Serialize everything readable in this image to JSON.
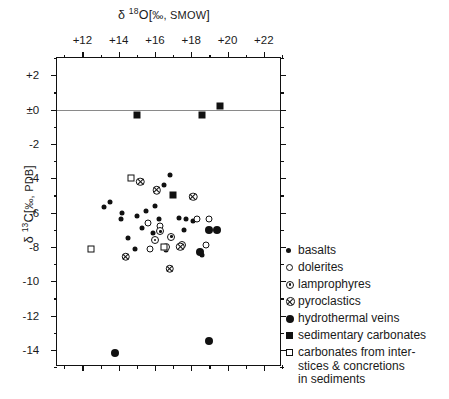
{
  "chart_data": {
    "type": "scatter",
    "title": "",
    "xlabel": "δ 18O[‰, SMOW]",
    "ylabel": "δ 13C[‰, PDB]",
    "xlim": [
      10.6,
      23.0
    ],
    "ylim": [
      -15.0,
      3.0
    ],
    "xticks": [
      "+12",
      "+14",
      "+16",
      "+18",
      "+20",
      "+22"
    ],
    "xtick_values": [
      12,
      14,
      16,
      18,
      20,
      22
    ],
    "yticks": [
      "+2",
      "±0",
      "-2",
      "-4",
      "-6",
      "-8",
      "-10",
      "-12",
      "-14"
    ],
    "ytick_values": [
      2,
      0,
      -2,
      -4,
      -6,
      -8,
      -10,
      -12,
      -14
    ],
    "minor_tick_step": 1,
    "grid": false,
    "zero_line": true,
    "legend_position": "right",
    "series": [
      {
        "name": "basalts",
        "marker": "filled-circle-small",
        "points": [
          [
            13.2,
            -5.7
          ],
          [
            13.5,
            -5.4
          ],
          [
            14.2,
            -6.0
          ],
          [
            14.1,
            -6.4
          ],
          [
            15.0,
            -6.2
          ],
          [
            15.5,
            -5.9
          ],
          [
            16.8,
            -3.8
          ],
          [
            16.5,
            -4.4
          ],
          [
            17.3,
            -6.3
          ],
          [
            17.7,
            -6.4
          ],
          [
            18.1,
            -6.5
          ],
          [
            16.2,
            -6.4
          ],
          [
            14.5,
            -7.5
          ],
          [
            14.9,
            -8.1
          ],
          [
            16.6,
            -8.2
          ],
          [
            17.6,
            -7.0
          ],
          [
            15.9,
            -7.2
          ],
          [
            18.6,
            -8.5
          ],
          [
            15.3,
            -6.9
          ],
          [
            16.0,
            -5.6
          ]
        ]
      },
      {
        "name": "dolerites",
        "marker": "open-circle",
        "points": [
          [
            15.6,
            -6.6
          ],
          [
            18.3,
            -6.4
          ],
          [
            15.7,
            -8.1
          ],
          [
            18.8,
            -7.9
          ],
          [
            16.3,
            -6.8
          ],
          [
            19.0,
            -6.4
          ]
        ]
      },
      {
        "name": "lamprophyres",
        "marker": "dotted-circle",
        "points": [
          [
            16.3,
            -7.1
          ],
          [
            16.0,
            -7.6
          ],
          [
            16.9,
            -7.4
          ],
          [
            17.5,
            -7.9
          ],
          [
            16.6,
            -8.0
          ]
        ]
      },
      {
        "name": "pyroclastics",
        "marker": "crossed-circle",
        "points": [
          [
            15.2,
            -4.2
          ],
          [
            16.1,
            -4.2
          ],
          [
            18.1,
            -4.1
          ],
          [
            17.4,
            -6.5
          ],
          [
            16.8,
            -7.3
          ],
          [
            14.4,
            -6.1
          ]
        ]
      },
      {
        "name": "hydrothermal veins",
        "marker": "filled-circle-large",
        "points": [
          [
            19.0,
            -7.0
          ],
          [
            19.4,
            -7.0
          ],
          [
            18.5,
            -8.3
          ],
          [
            19.0,
            -13.5
          ],
          [
            13.8,
            -14.2
          ]
        ]
      },
      {
        "name": "sedimentary carbonates",
        "marker": "filled-square",
        "points": [
          [
            15.0,
            -0.3
          ],
          [
            18.6,
            -0.3
          ],
          [
            19.6,
            0.2
          ],
          [
            17.0,
            -5.0
          ]
        ]
      },
      {
        "name": "carbonates from interstices & concretions in sediments",
        "marker": "open-square",
        "points": [
          [
            14.7,
            -4.0
          ],
          [
            12.5,
            -8.1
          ],
          [
            16.5,
            -8.0
          ]
        ]
      }
    ]
  },
  "legend": {
    "entries": [
      {
        "label": "basalts",
        "marker": "filled-circle-small"
      },
      {
        "label": "dolerites",
        "marker": "open-circle"
      },
      {
        "label": "lamprophyres",
        "marker": "dotted-circle"
      },
      {
        "label": "pyroclastics",
        "marker": "crossed-circle"
      },
      {
        "label": "hydrothermal veins",
        "marker": "filled-circle-large"
      },
      {
        "label": "sedimentary carbonates",
        "marker": "filled-square"
      },
      {
        "label": "carbonates from inter-\nstices & concretions\nin sediments",
        "marker": "open-square"
      }
    ]
  },
  "axes": {
    "x_title_parts": {
      "delta": "δ",
      "iso": "18",
      "element": "O[",
      "unit": "‰, SMOW",
      "close": "]"
    },
    "y_title_parts": {
      "delta": "δ",
      "iso": "13",
      "element": "C[",
      "unit": "‰, PDB",
      "close": "]"
    }
  }
}
